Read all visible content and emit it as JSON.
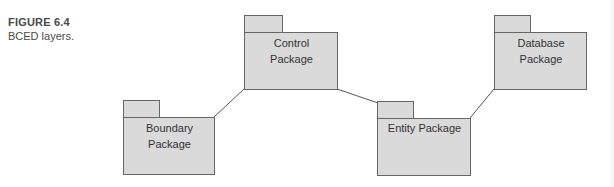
{
  "caption": {
    "label": "FIGURE 6.4",
    "title": "BCED layers."
  },
  "diagram": {
    "type": "UML package diagram",
    "colors": {
      "package_fill": "#dadada",
      "package_stroke": "#666666",
      "connector": "#555555",
      "text": "#333333"
    },
    "packages": [
      {
        "id": "control",
        "line1": "Control",
        "line2": "Package"
      },
      {
        "id": "boundary",
        "line1": "Boundary",
        "line2": "Package"
      },
      {
        "id": "entity",
        "line1": "Entity Package",
        "line2": ""
      },
      {
        "id": "database",
        "line1": "Database",
        "line2": "Package"
      }
    ],
    "connections": [
      {
        "from": "boundary",
        "to": "control"
      },
      {
        "from": "control",
        "to": "entity"
      },
      {
        "from": "entity",
        "to": "database"
      }
    ]
  }
}
